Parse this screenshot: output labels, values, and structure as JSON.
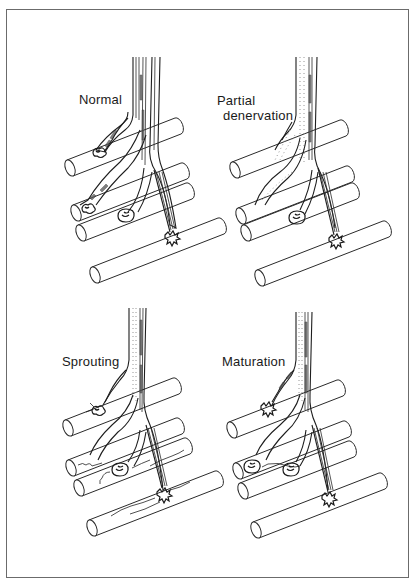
{
  "figure": {
    "panels": [
      {
        "id": "normal",
        "label_lines": [
          "Normal"
        ]
      },
      {
        "id": "partial-denervation",
        "label_lines": [
          "Partial",
          "denervation"
        ]
      },
      {
        "id": "sprouting",
        "label_lines": [
          "Sprouting"
        ]
      },
      {
        "id": "maturation",
        "label_lines": [
          "Maturation"
        ]
      }
    ]
  },
  "colors": {
    "border": "#6b6b6b",
    "ink": "#1a1a1a",
    "background": "#ffffff"
  }
}
